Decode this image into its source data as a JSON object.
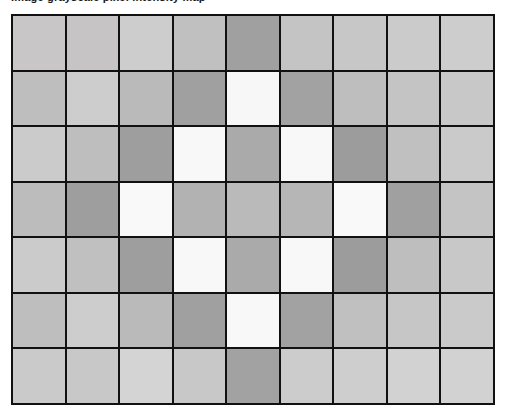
{
  "chart_data": {
    "type": "heatmap",
    "title": "Image grayscale pixel intensity map",
    "xlabel": "",
    "ylabel": "",
    "grid": true,
    "legend_position": "none",
    "colormap": "grayscale",
    "value_range": [
      0,
      255
    ],
    "rows": 7,
    "cols": 9,
    "x_tick_labels": [
      "1",
      "2",
      "3",
      "4",
      "5",
      "6",
      "7",
      "8",
      "9"
    ],
    "y_tick_labels": [
      "1",
      "2",
      "3",
      "4",
      "5",
      "6",
      "7"
    ],
    "cell_border_color": "#111111",
    "values": [
      [
        200,
        198,
        205,
        192,
        160,
        196,
        199,
        203,
        205
      ],
      [
        190,
        205,
        186,
        160,
        247,
        162,
        190,
        196,
        200
      ],
      [
        203,
        190,
        158,
        248,
        170,
        248,
        156,
        192,
        202
      ],
      [
        188,
        158,
        249,
        178,
        186,
        182,
        249,
        160,
        196
      ],
      [
        203,
        192,
        158,
        248,
        170,
        248,
        156,
        190,
        200
      ],
      [
        190,
        205,
        186,
        160,
        248,
        162,
        192,
        198,
        202
      ],
      [
        202,
        200,
        212,
        200,
        162,
        204,
        206,
        210,
        210
      ]
    ],
    "colors": [
      [
        "#c8c6c6",
        "#c6c4c4",
        "#cdcdcd",
        "#c0c0c0",
        "#a0a0a0",
        "#c4c4c4",
        "#c7c7c7",
        "#cbcbcb",
        "#cdcdcd"
      ],
      [
        "#bebebe",
        "#cdcdcd",
        "#bababa",
        "#a0a0a0",
        "#f7f7f7",
        "#a2a2a2",
        "#bebebe",
        "#c4c4c4",
        "#c8c8c8"
      ],
      [
        "#cbcbcb",
        "#bebebe",
        "#9e9e9e",
        "#f8f8f8",
        "#aaaaaa",
        "#f8f8f8",
        "#9c9c9c",
        "#c0c0c0",
        "#cacaca"
      ],
      [
        "#bcbcbc",
        "#9e9e9e",
        "#f9f9f9",
        "#b2b2b2",
        "#bababa",
        "#b6b6b6",
        "#f9f9f9",
        "#a0a0a0",
        "#c4c4c4"
      ],
      [
        "#cbcbcb",
        "#c0c0c0",
        "#9e9e9e",
        "#f8f8f8",
        "#aaaaaa",
        "#f8f8f8",
        "#9c9c9c",
        "#bebebe",
        "#c8c8c8"
      ],
      [
        "#bebebe",
        "#cdcdcd",
        "#bababa",
        "#a0a0a0",
        "#f8f8f8",
        "#a2a2a2",
        "#c0c0c0",
        "#c6c6c6",
        "#cacaca"
      ],
      [
        "#cacaca",
        "#c8c8c8",
        "#d4d4d4",
        "#c8c8c8",
        "#a2a2a2",
        "#cccccc",
        "#cecece",
        "#d2d2d2",
        "#d2d2d2"
      ]
    ]
  }
}
